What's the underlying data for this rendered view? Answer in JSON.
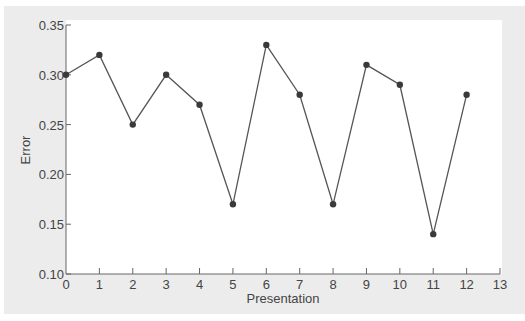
{
  "chart_data": {
    "type": "line",
    "title": "",
    "xlabel": "Presentation",
    "ylabel": "Error",
    "x": [
      0,
      1,
      2,
      3,
      4,
      5,
      6,
      7,
      8,
      9,
      10,
      11,
      12
    ],
    "values": [
      0.3,
      0.32,
      0.25,
      0.3,
      0.27,
      0.17,
      0.33,
      0.28,
      0.17,
      0.31,
      0.29,
      0.14,
      0.28
    ],
    "xlim": [
      0,
      13
    ],
    "ylim": [
      0.1,
      0.35
    ],
    "x_ticks": [
      "0",
      "1",
      "2",
      "3",
      "4",
      "5",
      "6",
      "7",
      "8",
      "9",
      "10",
      "11",
      "12",
      "13"
    ],
    "y_ticks": [
      "0.10",
      "0.15",
      "0.20",
      "0.25",
      "0.30",
      "0.35"
    ],
    "grid": false,
    "legend": null,
    "markers": true
  },
  "colors": {
    "line": "#555555",
    "marker": "#3a3a3a",
    "axis": "#666666",
    "frame": "#ececec",
    "plot_bg": "#ffffff"
  }
}
